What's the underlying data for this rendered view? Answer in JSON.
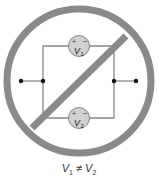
{
  "diagram": {
    "type": "circuit-prohibition",
    "sources": [
      {
        "id": "V1",
        "symbol": "V",
        "subscript": "1",
        "plus": "+",
        "minus": "−"
      },
      {
        "id": "V2",
        "symbol": "V",
        "subscript": "2",
        "plus": "+",
        "minus": "−"
      }
    ],
    "caption": {
      "left": "V",
      "left_sub": "1",
      "op": " ≠ ",
      "right": "V",
      "right_sub": "2"
    },
    "colors": {
      "ring": "#8a8a8a",
      "source_fill": "#d0d0d0",
      "wire": "#8a8a8a",
      "node": "#111111"
    }
  }
}
